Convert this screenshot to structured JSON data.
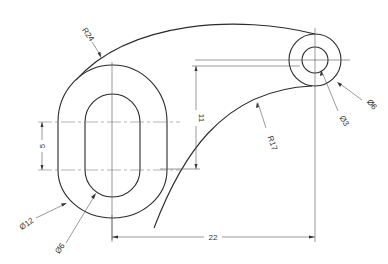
{
  "drawing": {
    "type": "technical-drawing",
    "part": "link-arm",
    "dimensions": {
      "outer_arc_radius": "R24",
      "inner_arc_radius": "R17",
      "boss_outer_diameter": "Ø6",
      "boss_inner_diameter": "Ø3",
      "slot_outer_width": "Ø12",
      "slot_inner_width": "Ø6",
      "slot_straight_length": "5",
      "vertical_offset": "11",
      "horizontal_distance": "22"
    },
    "colors": {
      "line": "#2b2b2b",
      "dimension": "#555555",
      "background": "#ffffff"
    }
  }
}
